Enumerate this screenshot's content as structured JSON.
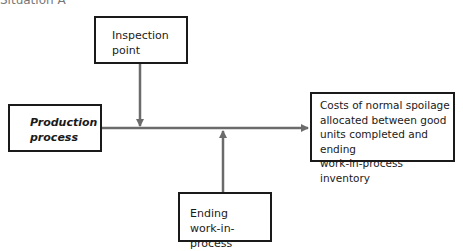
{
  "diagram": {
    "header": "Situation A",
    "nodes": {
      "inspection": {
        "lines": [
          "Inspection",
          "point"
        ]
      },
      "production": {
        "lines": [
          "Production",
          "process"
        ]
      },
      "costs": {
        "lines": [
          "Costs of normal spoilage",
          "allocated between good",
          "units completed and ending",
          "work-in-process inventory"
        ]
      },
      "ending": {
        "lines": [
          "Ending",
          "work-in-process"
        ]
      }
    },
    "edges": [
      {
        "from": "production",
        "to": "costs",
        "direction": "right"
      },
      {
        "from": "inspection",
        "to": "production-costs-line",
        "direction": "down"
      },
      {
        "from": "ending",
        "to": "production-costs-line",
        "direction": "up"
      }
    ],
    "colors": {
      "line": "#6b6b6b",
      "border": "#1a1a1a"
    }
  }
}
